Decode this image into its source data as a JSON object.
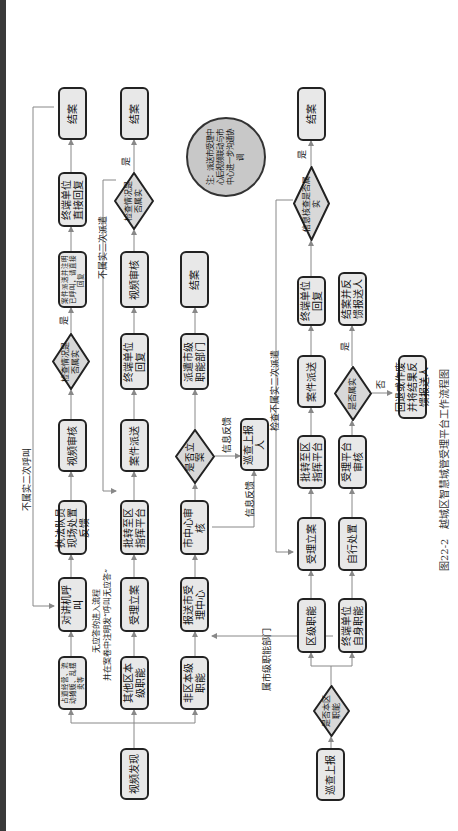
{
  "figure": {
    "caption": "图22-2　越城区智慧城管受理平台工作流程图",
    "note": "注：派送市受理中心后视频联动与市中心进一步沟通协调"
  },
  "colors": {
    "box_fill": "#e8e8e8",
    "border": "#222222",
    "line": "#888888",
    "note_fill": "#c8c8c8",
    "side_bar": "#3a3a3a"
  },
  "nodes": {
    "video_discovery": "视频发现",
    "patrol_report_start": "巡查上报",
    "street_issues": "占道经营、流动摊贩、乱摆卖等",
    "other_district_function": "其他区本级职能",
    "non_district_function": "非区本级职能",
    "is_district_function": "是否本区职能",
    "intercom_call": "对讲机呼叫",
    "accept_case_1": "受理立案",
    "send_city_center": "报送市受理中心",
    "district_function": "区级职能",
    "terminal_self_function": "终端单位自身职能",
    "enforcement_feedback": "执法队员现场处置反馈",
    "transfer_district_platform_1": "批转至区指挥平台",
    "city_center_review": "市中心审核",
    "accept_case_2": "受理立案",
    "self_handling": "自行处置",
    "video_review_1": "视频审核",
    "case_dispatch_1": "案件派送",
    "is_filed": "是否立案",
    "patrol_reporter": "巡查上报人",
    "transfer_district_platform_2": "批转至区指挥平台",
    "platform_review": "受理平台审核",
    "check_true_1": "检查情况是否属实",
    "terminal_reply_1": "终端单位回复",
    "dispatch_city_dept": "派遣市级职能部门",
    "case_dispatch_2": "案件派送",
    "is_true": "是否属实",
    "return_or_feedback": "回退或作废并将结果反馈报送人",
    "case_dispatch_call": "案件派送并注明已呼叫，请直接回复",
    "video_review_2": "视频审核",
    "close_case_city": "结案",
    "terminal_reply_2": "终端单位回复",
    "close_and_feedback": "结案并反馈报送人",
    "terminal_direct_reply": "终端单位直接回复",
    "check_true_2": "检查情况是否属实",
    "info_check_true": "信息核查是否属实",
    "close_case_1": "结案",
    "close_case_2": "结案",
    "close_case_3": "结案"
  },
  "edge_labels": {
    "no_answer": "无应答的进入流程",
    "no_answer_note": "并在案卷中注明发“呼叫无应答”",
    "not_true_recall": "不属实二次呼叫",
    "not_true_redispatch": "不属实二次派遣",
    "check_not_true_redispatch": "检查不属实二次派遣",
    "info_feedback_1": "信息反馈",
    "info_feedback_2": "信息反馈",
    "city_dept": "属市级职能部门",
    "yes_1": "是",
    "yes_2": "是",
    "yes_3": "是",
    "yes_4": "是",
    "no_1": "否"
  }
}
